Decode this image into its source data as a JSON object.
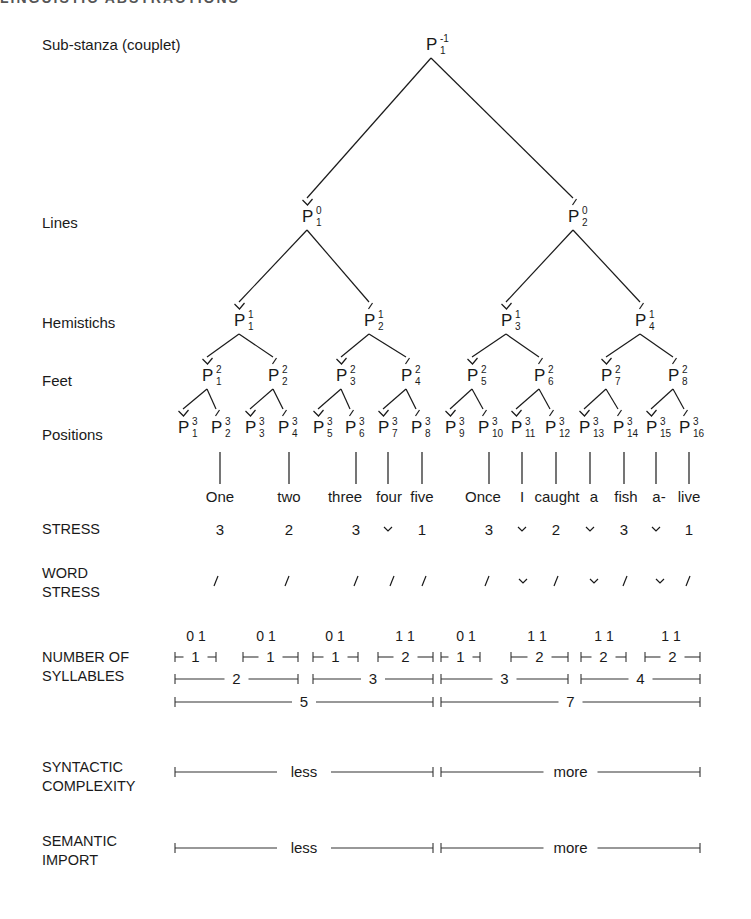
{
  "running_head": "LINGUISTIC ABSTRACTIONS",
  "labels": {
    "substanza": "Sub-stanza (couplet)",
    "lines": "Lines",
    "hemistichs": "Hemistichs",
    "feet": "Feet",
    "positions": "Positions",
    "stress": "STRESS",
    "word_stress": "WORD\nSTRESS",
    "syllables": "NUMBER OF\nSYLLABLES",
    "syntactic": "SYNTACTIC\nCOMPLEXITY",
    "semantic": "SEMANTIC\nIMPORT"
  },
  "tree": {
    "root": {
      "sup": "-1",
      "sub": "1",
      "accent": "none",
      "x": 431,
      "y": 50
    },
    "lines": [
      {
        "sup": "0",
        "sub": "1",
        "accent": "breve",
        "x": 307,
        "y": 222
      },
      {
        "sup": "0",
        "sub": "2",
        "accent": "acute",
        "x": 573,
        "y": 222
      }
    ],
    "hemistichs": [
      {
        "sup": "1",
        "sub": "1",
        "accent": "breve",
        "x": 239,
        "y": 326
      },
      {
        "sup": "1",
        "sub": "2",
        "accent": "acute",
        "x": 369,
        "y": 326
      },
      {
        "sup": "1",
        "sub": "3",
        "accent": "breve",
        "x": 506,
        "y": 326
      },
      {
        "sup": "1",
        "sub": "4",
        "accent": "acute",
        "x": 640,
        "y": 326
      }
    ],
    "feet": [
      {
        "sup": "2",
        "sub": "1",
        "accent": "breve",
        "x": 207,
        "y": 381
      },
      {
        "sup": "2",
        "sub": "2",
        "accent": "acute",
        "x": 273,
        "y": 381
      },
      {
        "sup": "2",
        "sub": "3",
        "accent": "breve",
        "x": 341,
        "y": 381
      },
      {
        "sup": "2",
        "sub": "4",
        "accent": "acute",
        "x": 406,
        "y": 381
      },
      {
        "sup": "2",
        "sub": "5",
        "accent": "breve",
        "x": 472,
        "y": 381
      },
      {
        "sup": "2",
        "sub": "6",
        "accent": "acute",
        "x": 539,
        "y": 381
      },
      {
        "sup": "2",
        "sub": "7",
        "accent": "breve",
        "x": 606,
        "y": 381
      },
      {
        "sup": "2",
        "sub": "8",
        "accent": "acute",
        "x": 673,
        "y": 381
      }
    ],
    "positions": [
      {
        "sup": "3",
        "sub": "1",
        "accent": "breve",
        "x": 183,
        "y": 433
      },
      {
        "sup": "3",
        "sub": "2",
        "accent": "acute",
        "x": 216,
        "y": 433
      },
      {
        "sup": "3",
        "sub": "3",
        "accent": "breve",
        "x": 250,
        "y": 433
      },
      {
        "sup": "3",
        "sub": "4",
        "accent": "acute",
        "x": 283,
        "y": 433
      },
      {
        "sup": "3",
        "sub": "5",
        "accent": "breve",
        "x": 318,
        "y": 433
      },
      {
        "sup": "3",
        "sub": "6",
        "accent": "acute",
        "x": 350,
        "y": 433
      },
      {
        "sup": "3",
        "sub": "7",
        "accent": "breve",
        "x": 383,
        "y": 433
      },
      {
        "sup": "3",
        "sub": "8",
        "accent": "acute",
        "x": 416,
        "y": 433
      },
      {
        "sup": "3",
        "sub": "9",
        "accent": "breve",
        "x": 450,
        "y": 433
      },
      {
        "sup": "3",
        "sub": "10",
        "accent": "acute",
        "x": 483,
        "y": 433
      },
      {
        "sup": "3",
        "sub": "11",
        "accent": "breve",
        "x": 516,
        "y": 433
      },
      {
        "sup": "3",
        "sub": "12",
        "accent": "acute",
        "x": 550,
        "y": 433
      },
      {
        "sup": "3",
        "sub": "13",
        "accent": "breve",
        "x": 584,
        "y": 433
      },
      {
        "sup": "3",
        "sub": "14",
        "accent": "acute",
        "x": 618,
        "y": 433
      },
      {
        "sup": "3",
        "sub": "15",
        "accent": "breve",
        "x": 651,
        "y": 433
      },
      {
        "sup": "3",
        "sub": "16",
        "accent": "acute",
        "x": 684,
        "y": 433
      }
    ]
  },
  "drops": [
    220,
    289,
    356,
    388,
    422,
    489,
    522,
    556,
    590,
    624,
    656,
    689
  ],
  "words": [
    {
      "text": "One",
      "x": 220
    },
    {
      "text": "two",
      "x": 289
    },
    {
      "text": "three",
      "x": 345
    },
    {
      "text": "four",
      "x": 389
    },
    {
      "text": "five",
      "x": 422
    },
    {
      "text": "Once",
      "x": 483
    },
    {
      "text": "I",
      "x": 522
    },
    {
      "text": "caught",
      "x": 557
    },
    {
      "text": "a",
      "x": 594
    },
    {
      "text": "fish",
      "x": 626
    },
    {
      "text": "a-",
      "x": 659
    },
    {
      "text": "live",
      "x": 689
    }
  ],
  "stress": [
    {
      "v": "3",
      "x": 220
    },
    {
      "v": "2",
      "x": 289
    },
    {
      "v": "3",
      "x": 356
    },
    {
      "v": "˘",
      "x": 388
    },
    {
      "v": "1",
      "x": 422
    },
    {
      "v": "3",
      "x": 489
    },
    {
      "v": "˘",
      "x": 522
    },
    {
      "v": "2",
      "x": 556
    },
    {
      "v": "˘",
      "x": 590
    },
    {
      "v": "3",
      "x": 624
    },
    {
      "v": "˘",
      "x": 656
    },
    {
      "v": "1",
      "x": 689
    }
  ],
  "word_stress": [
    {
      "v": "/",
      "x": 216
    },
    {
      "v": "/",
      "x": 287
    },
    {
      "v": "/",
      "x": 356
    },
    {
      "v": "/",
      "x": 392
    },
    {
      "v": "/",
      "x": 424
    },
    {
      "v": "/",
      "x": 487
    },
    {
      "v": "˘",
      "x": 523
    },
    {
      "v": "/",
      "x": 556
    },
    {
      "v": "˘",
      "x": 594
    },
    {
      "v": "/",
      "x": 625
    },
    {
      "v": "˘",
      "x": 660
    },
    {
      "v": "/",
      "x": 688
    }
  ],
  "syllable_pairs": [
    {
      "v": "0 1",
      "x": 196
    },
    {
      "v": "0 1",
      "x": 266
    },
    {
      "v": "0 1",
      "x": 335
    },
    {
      "v": "1 1",
      "x": 405
    },
    {
      "v": "0 1",
      "x": 466
    },
    {
      "v": "1 1",
      "x": 537
    },
    {
      "v": "1 1",
      "x": 604
    },
    {
      "v": "1 1",
      "x": 671
    }
  ],
  "syllable_spans": {
    "feet": [
      {
        "label": "1",
        "x1": 175,
        "x2": 216
      },
      {
        "label": "1",
        "x1": 243,
        "x2": 298
      },
      {
        "label": "1",
        "x1": 313,
        "x2": 358
      },
      {
        "label": "2",
        "x1": 378,
        "x2": 433
      },
      {
        "label": "1",
        "x1": 441,
        "x2": 480
      },
      {
        "label": "2",
        "x1": 511,
        "x2": 568
      },
      {
        "label": "2",
        "x1": 581,
        "x2": 626
      },
      {
        "label": "2",
        "x1": 645,
        "x2": 700
      }
    ],
    "hemistichs": [
      {
        "label": "2",
        "x1": 175,
        "x2": 298
      },
      {
        "label": "3",
        "x1": 313,
        "x2": 433
      },
      {
        "label": "3",
        "x1": 441,
        "x2": 568
      },
      {
        "label": "4",
        "x1": 581,
        "x2": 700
      }
    ],
    "lines": [
      {
        "label": "5",
        "x1": 175,
        "x2": 433
      },
      {
        "label": "7",
        "x1": 441,
        "x2": 700
      }
    ]
  },
  "syntactic_spans": [
    {
      "label": "less",
      "x1": 175,
      "x2": 433
    },
    {
      "label": "more",
      "x1": 441,
      "x2": 700
    }
  ],
  "semantic_spans": [
    {
      "label": "less",
      "x1": 175,
      "x2": 433
    },
    {
      "label": "more",
      "x1": 441,
      "x2": 700
    }
  ]
}
